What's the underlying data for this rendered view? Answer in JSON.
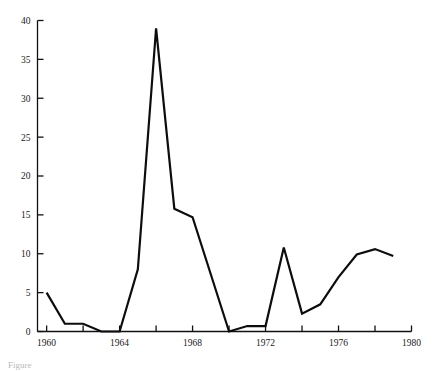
{
  "chart_data": {
    "type": "line",
    "title": "",
    "subtitle": "",
    "xlabel": "",
    "ylabel": "",
    "x": [
      1960,
      1961,
      1962,
      1963,
      1964,
      1965,
      1966,
      1967,
      1968,
      1970,
      1971,
      1972,
      1973,
      1974,
      1975,
      1976,
      1977,
      1978,
      1979
    ],
    "values": [
      5.0,
      1.0,
      1.0,
      0.0,
      0.0,
      8.0,
      39.0,
      15.8,
      14.7,
      0.0,
      0.7,
      0.7,
      10.8,
      2.3,
      3.5,
      7.0,
      9.9,
      10.6,
      9.7
    ],
    "series": [
      {
        "name": "series-1",
        "values": [
          5.0,
          1.0,
          1.0,
          0.0,
          0.0,
          8.0,
          39.0,
          15.8,
          14.7,
          0.0,
          0.7,
          0.7,
          10.8,
          2.3,
          3.5,
          7.0,
          9.9,
          10.6,
          9.7
        ]
      }
    ],
    "xlim": [
      1959.5,
      1980
    ],
    "ylim": [
      0,
      40
    ],
    "xticks": [
      1960,
      1962,
      1964,
      1966,
      1968,
      1970,
      1972,
      1974,
      1976,
      1978,
      1980
    ],
    "xtick_labels": [
      "1960",
      "",
      "1964",
      "",
      "1968",
      "",
      "1972",
      "",
      "1976",
      "",
      "1980"
    ],
    "yticks": [
      0,
      5,
      10,
      15,
      20,
      25,
      30,
      35,
      40
    ],
    "ytick_labels": [
      "0",
      "5",
      "10",
      "15",
      "20",
      "25",
      "30",
      "35",
      "40"
    ],
    "grid": false,
    "legend": false,
    "legend_position": "none",
    "line_color": "#0d0d0d",
    "axis_color": "#111111"
  },
  "axes": {
    "x_tick_labels": [
      {
        "value": 1960,
        "label": "1960",
        "major": true
      },
      {
        "value": 1962,
        "label": "",
        "major": false
      },
      {
        "value": 1964,
        "label": "1964",
        "major": true
      },
      {
        "value": 1966,
        "label": "",
        "major": false
      },
      {
        "value": 1968,
        "label": "1968",
        "major": true
      },
      {
        "value": 1970,
        "label": "",
        "major": false
      },
      {
        "value": 1972,
        "label": "1972",
        "major": true
      },
      {
        "value": 1974,
        "label": "",
        "major": false
      },
      {
        "value": 1976,
        "label": "1976",
        "major": true
      },
      {
        "value": 1978,
        "label": "",
        "major": false
      },
      {
        "value": 1980,
        "label": "1980",
        "major": true
      }
    ],
    "y_tick_labels": [
      {
        "value": 0,
        "label": "0"
      },
      {
        "value": 5,
        "label": "5"
      },
      {
        "value": 10,
        "label": "10"
      },
      {
        "value": 15,
        "label": "15"
      },
      {
        "value": 20,
        "label": "20"
      },
      {
        "value": 25,
        "label": "25"
      },
      {
        "value": 30,
        "label": "30"
      },
      {
        "value": 35,
        "label": "35"
      },
      {
        "value": 40,
        "label": "40"
      }
    ]
  },
  "caption": {
    "text": "Figure"
  }
}
